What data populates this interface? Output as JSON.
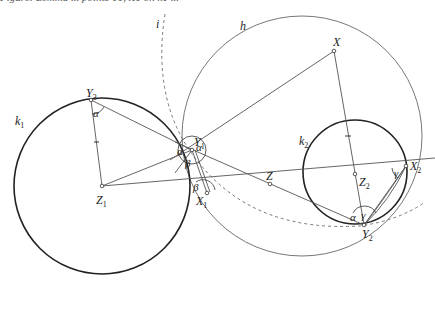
{
  "caption": "Figure: Lemma ... points Y1, X1 on k1 ...",
  "labels": {
    "k1": "k",
    "k1_sub": "1",
    "k2": "k",
    "k2_sub": "2",
    "h": "h",
    "i": "i",
    "X": "X",
    "Y3": "Y",
    "Y3_sub": "3",
    "Y1": "Y",
    "Y1_sub": "1",
    "X1": "X",
    "X1_sub": "1",
    "Z1": "Z",
    "Z1_sub": "1",
    "Z": "Z",
    "Z2": "Z",
    "Z2_sub": "2",
    "X2": "X",
    "X2_sub": "2",
    "Y2": "Y",
    "Y2_sub": "2"
  },
  "angles": {
    "alpha": "α",
    "beta": "β",
    "gamma": "γ"
  },
  "colors": {
    "thick_circle": "#222222",
    "thin_line": "#666666",
    "dashed": "#777777"
  }
}
